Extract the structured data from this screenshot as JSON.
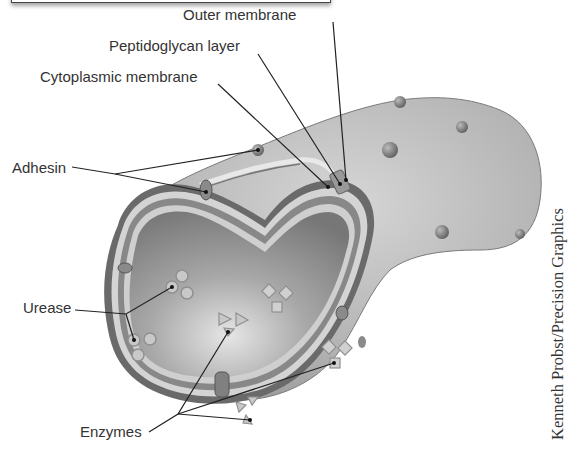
{
  "figure": {
    "labels": {
      "outer_membrane": "Outer membrane",
      "peptidoglycan_layer": "Peptidoglycan layer",
      "cytoplasmic_membrane": "Cytoplasmic membrane",
      "adhesin": "Adhesin",
      "urease": "Urease",
      "enzymes": "Enzymes"
    },
    "credit": "Kenneth Probst/Precision Graphics",
    "colors": {
      "body": "#b8b8b8",
      "cytoplasm": "#8a8a8a",
      "membrane_light": "#dcdcdc",
      "membrane_dark": "#6f6f6f",
      "leader_line": "#222222",
      "text": "#333333"
    }
  }
}
